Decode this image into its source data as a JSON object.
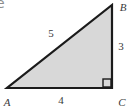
{
  "page": {
    "fragment_text": "e"
  },
  "figure": {
    "type": "right-triangle",
    "right_angle_at": "C",
    "colors": {
      "fill": "#d8d8d8",
      "stroke": "#1b1b1b"
    },
    "vertices": [
      {
        "label": "A",
        "position": "bottom-left"
      },
      {
        "label": "B",
        "position": "top-right"
      },
      {
        "label": "C",
        "position": "bottom-right"
      }
    ],
    "sides": [
      {
        "label": "5",
        "between": "AB",
        "role": "hypotenuse"
      },
      {
        "label": "3",
        "between": "BC",
        "role": "leg-vertical"
      },
      {
        "label": "4",
        "between": "AC",
        "role": "leg-horizontal"
      }
    ]
  }
}
